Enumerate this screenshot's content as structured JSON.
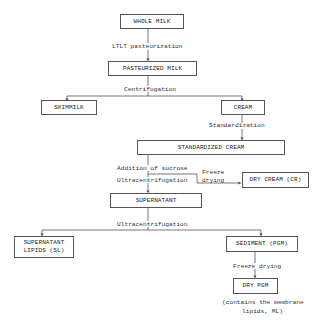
{
  "diagram": {
    "type": "flowchart",
    "nodes": {
      "whole_milk": "WHOLE MILK",
      "pasteurized_milk": "PASTEURIZED MILK",
      "skimmilk": "SKIMMILK",
      "cream": "CREAM",
      "standardized_cream": "STANDARDIZED CREAM",
      "dry_cream": "DRY CREAM (CR)",
      "supernatant": "SUPERNATANT",
      "supernatant_lipids_line1": "SUPERNATANT",
      "supernatant_lipids_line2": "LIPIDS (SL)",
      "sediment": "SEDIMENT (PGM)",
      "dry_pgm": "DRY PGM"
    },
    "edges": {
      "ltlt": "LTLT pasteurization",
      "centrifugation": "Centrifugation",
      "standardization": "Standardization",
      "addition_sucrose": "Addition of sucrose",
      "ultracentrifugation_1": "Ultracentrifugation",
      "freeze_1": "Freeze",
      "drying_1": "drying",
      "ultracentrifugation_2": "Ultracentrifugation",
      "freeze_drying_2": "Freeze drying"
    },
    "notes": {
      "membrane_line1": "(contains the membrane",
      "membrane_line2": "lipids, ML)"
    },
    "colors": {
      "line": "#555555",
      "text": "#222222",
      "background": "#ffffff"
    }
  }
}
